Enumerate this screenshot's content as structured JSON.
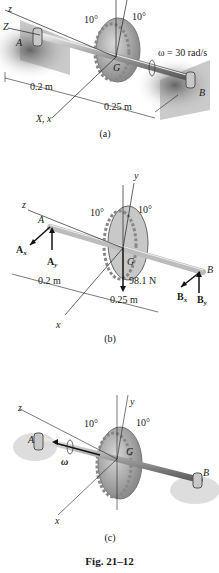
{
  "figure": {
    "caption": "Fig. 21–12",
    "panels": [
      {
        "id": "a",
        "caption": "(a)",
        "labels": {
          "z": "z",
          "Z": "Z",
          "A": "A",
          "B": "B",
          "G": "G",
          "angle1": "10°",
          "angle2": "10°",
          "omega": "ω = 30 rad/s",
          "dist1": "0.2 m",
          "dist2": "0.25 m",
          "Xx": "X, x"
        }
      },
      {
        "id": "b",
        "caption": "(b)",
        "labels": {
          "y": "y",
          "z": "z",
          "A": "A",
          "B": "B",
          "G": "G",
          "angle1": "10°",
          "angle2": "10°",
          "Ax": "A",
          "Ax_sub": "x",
          "Ay": "A",
          "Ay_sub": "y",
          "Bx": "B",
          "Bx_sub": "x",
          "By": "B",
          "By_sub": "y",
          "weight": "98.1 N",
          "dist1": "0.2 m",
          "dist2": "0.25 m",
          "x": "x"
        }
      },
      {
        "id": "c",
        "caption": "(c)",
        "labels": {
          "y": "y",
          "z": "z",
          "A": "A",
          "B": "B",
          "G": "G",
          "angle1": "10°",
          "angle2": "10°",
          "omega": "ω",
          "x": "x"
        }
      }
    ]
  }
}
